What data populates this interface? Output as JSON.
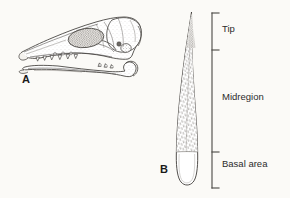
{
  "figure": {
    "background_color": "#fbfaf7",
    "ink_color": "#3a3a3a",
    "width": 290,
    "height": 198
  },
  "panels": [
    {
      "letter": "A",
      "name": "skull-and-mandible",
      "description": "Lateral view of a small mammal skull with separate lower jaw below"
    },
    {
      "letter": "B",
      "name": "elongate-structure",
      "description": "Elongate tapering stippled structure divided into three labeled zones"
    }
  ],
  "panel_a": {
    "letter": "A"
  },
  "panel_b": {
    "letter": "B",
    "bracket_labels": [
      {
        "text": "Tip",
        "zone": "tip"
      },
      {
        "text": "Midregion",
        "zone": "midregion"
      },
      {
        "text": "Basal area",
        "zone": "basal-area"
      }
    ]
  }
}
